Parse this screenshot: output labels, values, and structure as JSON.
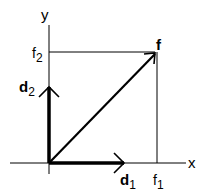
{
  "axes": {
    "x_label": "x",
    "y_label": "y"
  },
  "vectors": {
    "f": {
      "label": "f",
      "components": [
        "f1",
        "f2"
      ]
    },
    "d1": {
      "label": "d",
      "subscript": "1"
    },
    "d2": {
      "label": "d",
      "subscript": "2"
    }
  },
  "ticks": {
    "f1": {
      "label": "f",
      "subscript": "1"
    },
    "f2": {
      "label": "f",
      "subscript": "2"
    }
  },
  "colors": {
    "ink": "#000000",
    "background": "#ffffff"
  }
}
